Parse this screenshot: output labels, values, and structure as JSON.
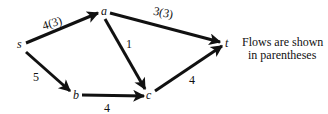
{
  "diagram": {
    "nodes": [
      {
        "id": "s",
        "label": "s"
      },
      {
        "id": "a",
        "label": "a"
      },
      {
        "id": "b",
        "label": "b"
      },
      {
        "id": "c",
        "label": "c"
      },
      {
        "id": "t",
        "label": "t"
      }
    ],
    "edges": [
      {
        "from": "s",
        "to": "a",
        "capacity": 4,
        "flow": 3,
        "label": "4(3)"
      },
      {
        "from": "a",
        "to": "t",
        "capacity": 3,
        "flow": 3,
        "label": "3(3)"
      },
      {
        "from": "a",
        "to": "c",
        "capacity": 1,
        "flow": null,
        "label": "1"
      },
      {
        "from": "s",
        "to": "b",
        "capacity": 5,
        "flow": null,
        "label": "5"
      },
      {
        "from": "b",
        "to": "c",
        "capacity": 4,
        "flow": null,
        "label": "4"
      },
      {
        "from": "c",
        "to": "t",
        "capacity": 4,
        "flow": null,
        "label": "4"
      }
    ],
    "caption": {
      "line1": "Flows are shown",
      "line2": "in parentheses"
    }
  }
}
